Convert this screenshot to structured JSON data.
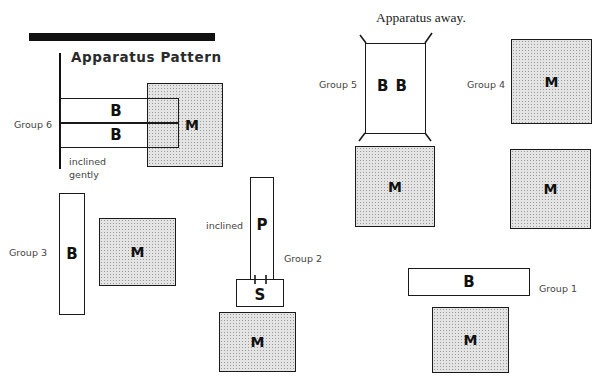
{
  "header": {
    "title": "Apparatus Pattern",
    "subtitle": "Apparatus away."
  },
  "legend": {
    "B": "bench",
    "M": "mat",
    "P": "plank",
    "S": "box"
  },
  "colors": {
    "ink": "#111111",
    "mat_fill": "#e4e4e4",
    "mat_dots": "#9a9a9a",
    "label_text": "#444444"
  },
  "groups": [
    {
      "id": "group-1",
      "label": "Group 1",
      "items": [
        {
          "type": "bench",
          "letter": "B",
          "orientation": "horizontal"
        },
        {
          "type": "mat",
          "letter": "M"
        }
      ]
    },
    {
      "id": "group-2",
      "label": "Group 2",
      "note": "inclined",
      "items": [
        {
          "type": "plank",
          "letter": "P",
          "orientation": "vertical"
        },
        {
          "type": "box",
          "letter": "S"
        },
        {
          "type": "mat",
          "letter": "M"
        }
      ]
    },
    {
      "id": "group-3",
      "label": "Group 3",
      "items": [
        {
          "type": "bench",
          "letter": "B",
          "orientation": "vertical"
        },
        {
          "type": "mat",
          "letter": "M"
        }
      ]
    },
    {
      "id": "group-4",
      "label": "Group 4",
      "items": [
        {
          "type": "mat",
          "letter": "M"
        },
        {
          "type": "mat",
          "letter": "M"
        }
      ]
    },
    {
      "id": "group-5",
      "label": "Group 5",
      "items": [
        {
          "type": "frame",
          "letter": "B B"
        },
        {
          "type": "mat",
          "letter": "M"
        }
      ]
    },
    {
      "id": "group-6",
      "label": "Group 6",
      "note_line1": "inclined",
      "note_line2": "gently",
      "items": [
        {
          "type": "bench",
          "letter": "B",
          "orientation": "horizontal"
        },
        {
          "type": "bench",
          "letter": "B",
          "orientation": "horizontal"
        },
        {
          "type": "mat",
          "letter": "M"
        }
      ]
    }
  ]
}
